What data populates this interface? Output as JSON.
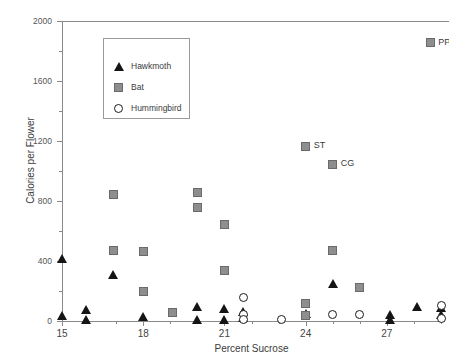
{
  "chart_data": {
    "type": "scatter",
    "title": "",
    "xlabel": "Percent Sucrose",
    "ylabel": "Calories per Flower",
    "xlim": [
      15,
      29
    ],
    "ylim": [
      0,
      2000
    ],
    "x_ticks": [
      "15",
      "18",
      "21",
      "24",
      "27"
    ],
    "x_tick_values": [
      15,
      18,
      21,
      24,
      27
    ],
    "y_ticks": [
      "0",
      "400",
      "800",
      "1200",
      "1600",
      "2000"
    ],
    "y_tick_values": [
      0,
      400,
      800,
      1200,
      1600,
      2000
    ],
    "grid": false,
    "legend_position": "upper-left",
    "series": [
      {
        "name": "Hawkmoth",
        "marker": "triangle",
        "color": "#151515",
        "points": [
          {
            "x": 15.0,
            "y": 415
          },
          {
            "x": 15.0,
            "y": 35
          },
          {
            "x": 15.9,
            "y": 75
          },
          {
            "x": 15.9,
            "y": 10
          },
          {
            "x": 16.9,
            "y": 310
          },
          {
            "x": 18.0,
            "y": 30
          },
          {
            "x": 20.0,
            "y": 95
          },
          {
            "x": 20.0,
            "y": 5
          },
          {
            "x": 21.0,
            "y": 80
          },
          {
            "x": 21.0,
            "y": 5
          },
          {
            "x": 21.7,
            "y": 60
          },
          {
            "x": 21.7,
            "y": 20
          },
          {
            "x": 24.0,
            "y": 45
          },
          {
            "x": 25.0,
            "y": 250
          },
          {
            "x": 27.1,
            "y": 40
          },
          {
            "x": 27.1,
            "y": 10
          },
          {
            "x": 28.1,
            "y": 95
          },
          {
            "x": 29.0,
            "y": 85
          },
          {
            "x": 29.0,
            "y": 40
          }
        ]
      },
      {
        "name": "Bat",
        "marker": "square",
        "color": "#8e8e8e",
        "points": [
          {
            "x": 16.9,
            "y": 845
          },
          {
            "x": 16.9,
            "y": 470
          },
          {
            "x": 18.0,
            "y": 465
          },
          {
            "x": 18.0,
            "y": 200
          },
          {
            "x": 19.1,
            "y": 55
          },
          {
            "x": 20.0,
            "y": 855
          },
          {
            "x": 20.0,
            "y": 760
          },
          {
            "x": 21.0,
            "y": 645
          },
          {
            "x": 21.0,
            "y": 335
          },
          {
            "x": 24.0,
            "y": 120
          },
          {
            "x": 24.0,
            "y": 35
          },
          {
            "x": 25.0,
            "y": 470
          },
          {
            "x": 26.0,
            "y": 225
          }
        ]
      },
      {
        "name": "Hummingbird",
        "marker": "circle",
        "color": "#ffffff",
        "points": [
          {
            "x": 21.7,
            "y": 160
          },
          {
            "x": 21.7,
            "y": 45
          },
          {
            "x": 21.7,
            "y": 10
          },
          {
            "x": 23.1,
            "y": 8
          },
          {
            "x": 25.0,
            "y": 45
          },
          {
            "x": 26.0,
            "y": 45
          },
          {
            "x": 29.0,
            "y": 105
          },
          {
            "x": 29.0,
            "y": 15
          }
        ]
      }
    ],
    "annotations": [
      {
        "label": "ST",
        "x": 24.0,
        "y": 1165,
        "series": "Bat"
      },
      {
        "label": "CG",
        "x": 25.0,
        "y": 1045,
        "series": "Bat"
      },
      {
        "label": "PP",
        "x": 28.6,
        "y": 1855,
        "series": "Bat"
      }
    ]
  },
  "legend": {
    "entries": [
      {
        "label": "Hawkmoth",
        "marker": "triangle"
      },
      {
        "label": "Bat",
        "marker": "square"
      },
      {
        "label": "Hummingbird",
        "marker": "circle"
      }
    ]
  }
}
